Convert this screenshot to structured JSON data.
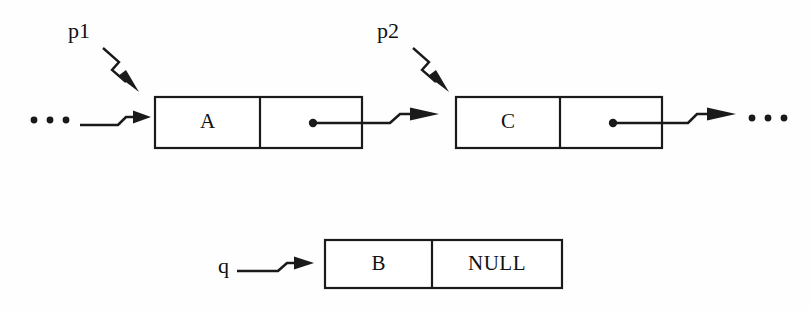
{
  "figure": {
    "kind": "linked-list-pointer-diagram",
    "background_color": "#fefefe",
    "ink_color": "#1a1a1a"
  },
  "nodes": [
    {
      "id": "node-a",
      "data_label": "A",
      "next_label": "",
      "next_kind": "pointer",
      "pointed_by": "p1"
    },
    {
      "id": "node-c",
      "data_label": "C",
      "next_label": "",
      "next_kind": "pointer",
      "pointed_by": "p2"
    },
    {
      "id": "node-b",
      "data_label": "B",
      "next_label": "NULL",
      "next_kind": "null",
      "pointed_by": "q"
    }
  ],
  "pointer_labels": {
    "p1": "p1",
    "p2": "p2",
    "q": "q"
  },
  "ellipsis": {
    "left": "• • •",
    "right": "• • •"
  }
}
